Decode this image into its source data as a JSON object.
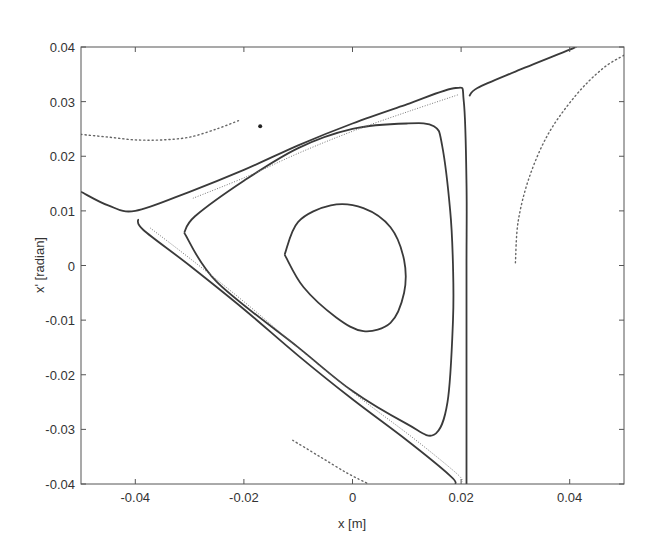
{
  "chart_data": {
    "type": "scatter",
    "title": "",
    "xlabel": "x [m]",
    "ylabel": "x' [radian]",
    "xlim": [
      -0.05,
      0.05
    ],
    "ylim": [
      -0.04,
      0.04
    ],
    "grid": false,
    "legend": null,
    "x_ticks": [
      -0.04,
      -0.02,
      0,
      0.02,
      0.04
    ],
    "x_tick_labels": [
      "-0.04",
      "-0.02",
      "0",
      "0.02",
      "0.04"
    ],
    "y_ticks": [
      0.04,
      0.03,
      0.02,
      0.01,
      0,
      -0.01,
      -0.02,
      -0.03,
      -0.04
    ],
    "y_tick_labels": [
      "0.04",
      "0.03",
      "0.02",
      "0.01",
      "0",
      "-0.01",
      "-0.02",
      "-0.03",
      "-0.04"
    ],
    "series": [
      {
        "name": "inner-orbit",
        "style": "solid",
        "points": [
          [
            -0.0125,
            0.002
          ],
          [
            -0.01,
            0.008
          ],
          [
            -0.004,
            0.011
          ],
          [
            0.002,
            0.0105
          ],
          [
            0.007,
            0.007
          ],
          [
            0.0095,
            0.001
          ],
          [
            0.0095,
            -0.005
          ],
          [
            0.007,
            -0.0105
          ],
          [
            0.002,
            -0.012
          ],
          [
            -0.003,
            -0.0095
          ],
          [
            -0.009,
            -0.004
          ],
          [
            -0.0125,
            0.002
          ]
        ]
      },
      {
        "name": "middle-orbit",
        "style": "solid",
        "points": [
          [
            -0.031,
            0.006
          ],
          [
            -0.029,
            0.009
          ],
          [
            -0.02,
            0.0155
          ],
          [
            -0.01,
            0.0215
          ],
          [
            0.0,
            0.025
          ],
          [
            0.01,
            0.026
          ],
          [
            0.015,
            0.0255
          ],
          [
            0.0165,
            0.022
          ],
          [
            0.018,
            0.01
          ],
          [
            0.0185,
            0.0
          ],
          [
            0.0185,
            -0.01
          ],
          [
            0.0175,
            -0.025
          ],
          [
            0.015,
            -0.031
          ],
          [
            0.01,
            -0.029
          ],
          [
            0.0,
            -0.023
          ],
          [
            -0.01,
            -0.015
          ],
          [
            -0.025,
            -0.003
          ],
          [
            -0.031,
            0.006
          ]
        ]
      },
      {
        "name": "separatrix-outer",
        "style": "solid",
        "points": [
          [
            -0.05,
            0.0135
          ],
          [
            -0.045,
            0.011
          ],
          [
            -0.04,
            0.01
          ],
          [
            -0.03,
            0.0135
          ],
          [
            -0.02,
            0.0175
          ],
          [
            -0.01,
            0.022
          ],
          [
            0.0,
            0.026
          ],
          [
            0.01,
            0.0295
          ],
          [
            0.019,
            0.0325
          ],
          [
            0.0205,
            0.03
          ],
          [
            0.021,
            0.015
          ],
          [
            0.021,
            0.0
          ],
          [
            0.021,
            -0.02
          ],
          [
            0.021,
            -0.04
          ]
        ]
      },
      {
        "name": "separatrix-triangle",
        "style": "solid",
        "points": [
          [
            -0.0395,
            0.0085
          ],
          [
            -0.0385,
            0.0065
          ],
          [
            -0.03,
            0.0
          ],
          [
            -0.02,
            -0.008
          ],
          [
            -0.01,
            -0.0165
          ],
          [
            0.0,
            -0.0245
          ],
          [
            0.01,
            -0.032
          ],
          [
            0.018,
            -0.0385
          ],
          [
            0.019,
            -0.04
          ]
        ]
      },
      {
        "name": "separatrix-right-branch",
        "style": "solid",
        "points": [
          [
            0.0215,
            0.031
          ],
          [
            0.023,
            0.0325
          ],
          [
            0.03,
            0.0355
          ],
          [
            0.04,
            0.0395
          ],
          [
            0.041,
            0.04
          ]
        ]
      },
      {
        "name": "dotted-upper-left",
        "style": "dotted",
        "points": [
          [
            -0.05,
            0.024
          ],
          [
            -0.045,
            0.0235
          ],
          [
            -0.04,
            0.023
          ],
          [
            -0.035,
            0.023
          ],
          [
            -0.03,
            0.0235
          ],
          [
            -0.025,
            0.025
          ],
          [
            -0.021,
            0.0265
          ]
        ]
      },
      {
        "name": "dotted-right",
        "style": "dotted",
        "points": [
          [
            0.03,
            0.0005
          ],
          [
            0.0305,
            0.008
          ],
          [
            0.0325,
            0.016
          ],
          [
            0.036,
            0.024
          ],
          [
            0.041,
            0.031
          ],
          [
            0.046,
            0.036
          ],
          [
            0.05,
            0.0385
          ]
        ]
      },
      {
        "name": "dotted-lower",
        "style": "dotted",
        "points": [
          [
            -0.011,
            -0.032
          ],
          [
            -0.006,
            -0.035
          ],
          [
            -0.001,
            -0.038
          ],
          [
            0.003,
            -0.04
          ]
        ]
      },
      {
        "name": "isolated-point",
        "style": "marker",
        "points": [
          [
            -0.017,
            0.0255
          ]
        ]
      }
    ]
  }
}
